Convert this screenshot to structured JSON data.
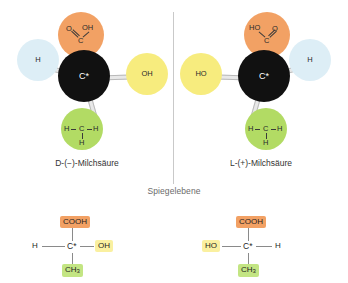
{
  "diagram": {
    "mirror_plane_label": "Spiegelebene",
    "colors": {
      "carboxyl": "#f2a164",
      "hydroxyl": "#f7ec7e",
      "hydrogen": "#ddeef6",
      "methyl": "#b2db64",
      "chiral_carbon": "#111111",
      "mirror_line": "#c9c9c9",
      "bond": "#e8e8e8"
    },
    "models": [
      {
        "caption": "D-(−)-Milchsäure",
        "chiral_carbon": "C*",
        "carboxyl": {
          "oxygen": "O",
          "hydroxyl": "OH",
          "carbon": "C"
        },
        "hydrogen": "H",
        "hydroxyl": "OH",
        "methyl": {
          "left_h": "H",
          "carbon": "C",
          "right_h": "H",
          "bottom_h": "H"
        }
      },
      {
        "caption": "L-(+)-Milchsäure",
        "chiral_carbon": "C*",
        "carboxyl": {
          "oxygen": "O",
          "hydroxyl": "HO",
          "carbon": "C"
        },
        "hydrogen": "H",
        "hydroxyl": "HO",
        "methyl": {
          "left_h": "H",
          "carbon": "C",
          "right_h": "H",
          "bottom_h": "H"
        }
      }
    ],
    "fischer": [
      {
        "top": "COOH",
        "left": "H",
        "center": "C*",
        "right": "OH",
        "bottom": "CH3",
        "bottom_base": "CH",
        "bottom_sub": "3"
      },
      {
        "top": "COOH",
        "left": "HO",
        "center": "C*",
        "right": "H",
        "bottom": "CH3",
        "bottom_base": "CH",
        "bottom_sub": "3"
      }
    ]
  }
}
